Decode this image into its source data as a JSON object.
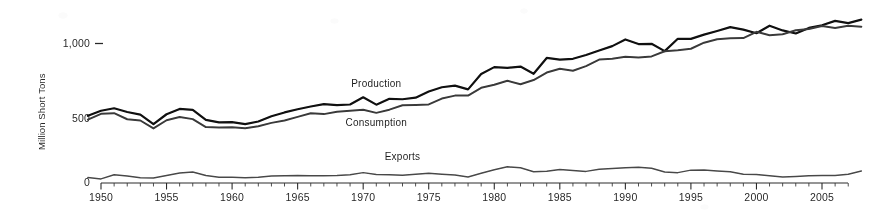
{
  "chart_data": {
    "type": "line",
    "title": "",
    "xlabel": "",
    "ylabel": "Million Short Tons",
    "ylim": [
      0,
      1200
    ],
    "xlim": [
      1949,
      2008
    ],
    "grid": false,
    "legend_position": "inline-series-labels",
    "ytick_labels": [
      "0",
      "500",
      "1,000"
    ],
    "ytick_values": [
      0,
      500,
      1000
    ],
    "xtick_labels": [
      "1950",
      "1955",
      "1960",
      "1965",
      "1970",
      "1975",
      "1980",
      "1985",
      "1990",
      "1995",
      "2000",
      "2005"
    ],
    "xtick_values": [
      1950,
      1955,
      1960,
      1965,
      1970,
      1975,
      1980,
      1985,
      1990,
      1995,
      2000,
      2005
    ],
    "x": [
      1949,
      1950,
      1951,
      1952,
      1953,
      1954,
      1955,
      1956,
      1957,
      1958,
      1959,
      1960,
      1961,
      1962,
      1963,
      1964,
      1965,
      1966,
      1967,
      1968,
      1969,
      1970,
      1971,
      1972,
      1973,
      1974,
      1975,
      1976,
      1977,
      1978,
      1979,
      1980,
      1981,
      1982,
      1983,
      1984,
      1985,
      1986,
      1987,
      1988,
      1989,
      1990,
      1991,
      1992,
      1993,
      1994,
      1995,
      1996,
      1997,
      1998,
      1999,
      2000,
      2001,
      2002,
      2003,
      2004,
      2005,
      2006,
      2007,
      2008
    ],
    "series": [
      {
        "name": "Production",
        "values": [
          480,
          516,
          534,
          507,
          488,
          420,
          491,
          529,
          523,
          450,
          432,
          434,
          420,
          439,
          477,
          504,
          527,
          547,
          564,
          557,
          561,
          613,
          560,
          602,
          599,
          610,
          655,
          685,
          697,
          670,
          781,
          830,
          824,
          834,
          782,
          896,
          884,
          890,
          917,
          950,
          981,
          1029,
          996,
          998,
          945,
          1034,
          1033,
          1064,
          1090,
          1118,
          1100,
          1074,
          1128,
          1094,
          1072,
          1112,
          1131,
          1163,
          1147,
          1172
        ]
      },
      {
        "name": "Consumption",
        "values": [
          452,
          494,
          499,
          455,
          446,
          389,
          448,
          471,
          456,
          399,
          396,
          398,
          390,
          404,
          429,
          446,
          472,
          498,
          492,
          509,
          516,
          523,
          501,
          524,
          556,
          558,
          562,
          604,
          625,
          625,
          681,
          703,
          732,
          707,
          737,
          791,
          818,
          804,
          837,
          884,
          891,
          904,
          900,
          907,
          944,
          951,
          962,
          1006,
          1030,
          1037,
          1039,
          1084,
          1060,
          1066,
          1095,
          1104,
          1126,
          1112,
          1128,
          1121
        ]
      },
      {
        "name": "Exports",
        "values": [
          36,
          26,
          56,
          47,
          34,
          32,
          51,
          69,
          76,
          50,
          37,
          37,
          35,
          38,
          47,
          48,
          50,
          49,
          49,
          51,
          56,
          71,
          57,
          56,
          53,
          60,
          66,
          60,
          54,
          40,
          66,
          92,
          113,
          106,
          78,
          81,
          93,
          86,
          80,
          95,
          101,
          106,
          109,
          103,
          75,
          71,
          89,
          90,
          83,
          78,
          59,
          58,
          49,
          40,
          43,
          48,
          50,
          50,
          59,
          83
        ]
      }
    ],
    "annotations": [
      {
        "text": "Production",
        "x": 1971,
        "y": 690
      },
      {
        "text": "Consumption",
        "x": 1971,
        "y": 410
      },
      {
        "text": "Exports",
        "x": 1973,
        "y": 160
      }
    ]
  },
  "axis": {
    "y_title": "Million Short Tons"
  },
  "colors": {
    "production": "#141414",
    "consumption": "#3d3d3d",
    "exports": "#4a4a4a",
    "axis": "#2b2b2b",
    "background": "#ffffff"
  }
}
